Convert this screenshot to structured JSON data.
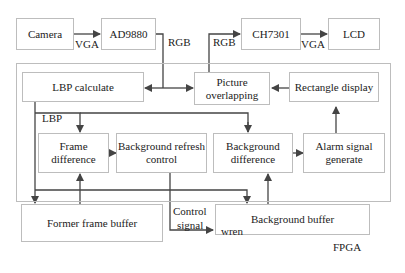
{
  "diagram": {
    "external": {
      "camera": "Camera",
      "ad9880": "AD9880",
      "ch7301": "CH7301",
      "lcd": "LCD"
    },
    "fpga": {
      "label": "FPGA",
      "blocks": {
        "lbp_calculate": "LBP calculate",
        "picture_overlapping": "Picture overlapping",
        "rectangle_display": "Rectangle display",
        "frame_difference": "Frame difference",
        "background_refresh_control": "Background refresh control",
        "background_difference": "Background difference",
        "alarm_signal_generate": "Alarm signal generate",
        "former_frame_buffer": "Former frame buffer",
        "background_buffer": "Background buffer"
      }
    },
    "edge_labels": {
      "vga_in": "VGA",
      "rgb_in": "RGB",
      "rgb_out": "RGB",
      "vga_out": "VGA",
      "lbp": "LBP",
      "control_signal_1": "Control",
      "control_signal_2": "signal",
      "wren": "wren"
    },
    "edges": [
      {
        "from": "Camera",
        "to": "AD9880",
        "label": "VGA"
      },
      {
        "from": "AD9880",
        "to": "LBP calculate",
        "label": "RGB"
      },
      {
        "from": "AD9880",
        "to": "Picture overlapping",
        "label": "RGB"
      },
      {
        "from": "Picture overlapping",
        "to": "CH7301",
        "label": "RGB"
      },
      {
        "from": "CH7301",
        "to": "LCD",
        "label": "VGA"
      },
      {
        "from": "Rectangle display",
        "to": "Picture overlapping"
      },
      {
        "from": "LBP calculate",
        "to": "Frame difference",
        "label": "LBP"
      },
      {
        "from": "LBP calculate",
        "to": "Background difference"
      },
      {
        "from": "LBP calculate",
        "to": "Former frame buffer"
      },
      {
        "from": "LBP calculate",
        "to": "Background buffer"
      },
      {
        "from": "Frame difference",
        "to": "Background refresh control"
      },
      {
        "from": "Former frame buffer",
        "to": "Frame difference"
      },
      {
        "from": "Background refresh control",
        "to": "Background buffer",
        "label": "Control signal / wren"
      },
      {
        "from": "Background buffer",
        "to": "Background difference"
      },
      {
        "from": "Background difference",
        "to": "Alarm signal generate"
      },
      {
        "from": "Alarm signal generate",
        "to": "Rectangle display"
      }
    ]
  }
}
